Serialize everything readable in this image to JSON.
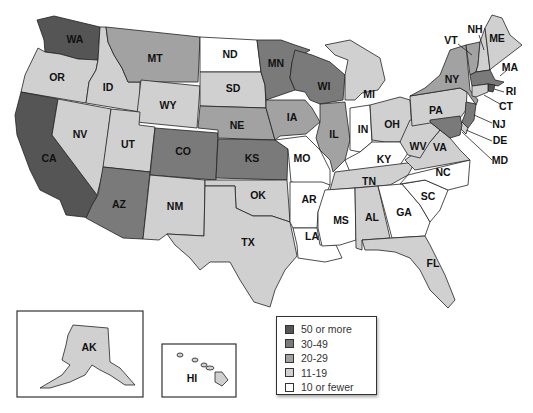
{
  "title": "",
  "categories": [
    {
      "id": "c50",
      "label": "50 or more",
      "color": "#555555"
    },
    {
      "id": "c30",
      "label": "30-49",
      "color": "#7a7a7a"
    },
    {
      "id": "c20",
      "label": "20-29",
      "color": "#a2a2a2"
    },
    {
      "id": "c11",
      "label": "11-19",
      "color": "#d0d0d0"
    },
    {
      "id": "c10",
      "label": "10 or fewer",
      "color": "#ffffff"
    }
  ],
  "states": {
    "WA": "c50",
    "OR": "c11",
    "CA": "c50",
    "ID": "c11",
    "NV": "c11",
    "MT": "c20",
    "WY": "c11",
    "UT": "c11",
    "AZ": "c30",
    "CO": "c30",
    "NM": "c11",
    "ND": "c10",
    "SD": "c11",
    "NE": "c20",
    "KS": "c30",
    "OK": "c11",
    "TX": "c11",
    "MN": "c30",
    "IA": "c20",
    "MO": "c10",
    "AR": "c10",
    "LA": "c10",
    "WI": "c30",
    "IL": "c20",
    "MI": "c11",
    "IN": "c10",
    "OH": "c11",
    "KY": "c10",
    "TN": "c11",
    "MS": "c10",
    "AL": "c11",
    "GA": "c10",
    "FL": "c11",
    "SC": "c10",
    "NC": "c10",
    "VA": "c11",
    "WV": "c11",
    "PA": "c11",
    "NY": "c20",
    "VT": "c20",
    "NH": "c11",
    "ME": "c11",
    "MA": "c30",
    "RI": "c50",
    "CT": "c11",
    "NJ": "c30",
    "DE": "c11",
    "MD": "c30",
    "AK": "c11",
    "HI": "c11"
  },
  "labels": {
    "WA": "WA",
    "OR": "OR",
    "CA": "CA",
    "ID": "ID",
    "NV": "NV",
    "MT": "MT",
    "WY": "WY",
    "UT": "UT",
    "AZ": "AZ",
    "CO": "CO",
    "NM": "NM",
    "ND": "ND",
    "SD": "SD",
    "NE": "NE",
    "KS": "KS",
    "OK": "OK",
    "TX": "TX",
    "MN": "MN",
    "IA": "IA",
    "MO": "MO",
    "AR": "AR",
    "LA": "LA",
    "WI": "WI",
    "IL": "IL",
    "MI": "MI",
    "IN": "IN",
    "OH": "OH",
    "KY": "KY",
    "TN": "TN",
    "MS": "MS",
    "AL": "AL",
    "GA": "GA",
    "FL": "FL",
    "SC": "SC",
    "NC": "NC",
    "VA": "VA",
    "WV": "WV",
    "PA": "PA",
    "NY": "NY",
    "VT": "VT",
    "NH": "NH",
    "ME": "ME",
    "MA": "MA",
    "RI": "RI",
    "CT": "CT",
    "NJ": "NJ",
    "DE": "DE",
    "MD": "MD",
    "AK": "AK",
    "HI": "HI"
  },
  "legend": {
    "items": [
      "50 or more",
      "30-49",
      "20-29",
      "11-19",
      "10 or fewer"
    ]
  }
}
